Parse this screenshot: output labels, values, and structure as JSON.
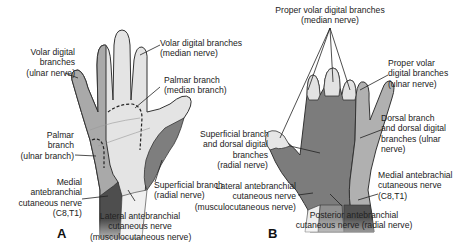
{
  "figure": {
    "panels": [
      {
        "id": "A",
        "view": "palmar",
        "letter": "A",
        "labels": [
          {
            "id": "volar-digital-ulnar",
            "lines": [
              "Volar digital",
              "branches",
              "(ulnar nerve)"
            ]
          },
          {
            "id": "volar-digital-median",
            "lines": [
              "Volar digital branches",
              "(median nerve)"
            ]
          },
          {
            "id": "palmar-branch-median",
            "lines": [
              "Palmar branch",
              "(median branch)"
            ]
          },
          {
            "id": "palmar-branch-ulnar",
            "lines": [
              "Palmar",
              "branch",
              "(ulnar branch)"
            ]
          },
          {
            "id": "medial-antebrachial-A",
            "lines": [
              "Medial",
              "antebranchial",
              "cutaneous nerve",
              "(C8,T1)"
            ]
          },
          {
            "id": "superficial-branch-radial",
            "lines": [
              "Superficial branch",
              "(radial nerve)"
            ]
          },
          {
            "id": "lateral-antebrachial-A",
            "lines": [
              "Lateral antebranchial",
              "cutaneous nerve",
              "(musculocutaneous nerve)"
            ]
          }
        ]
      },
      {
        "id": "B",
        "view": "dorsal",
        "letter": "B",
        "labels": [
          {
            "id": "proper-volar-median",
            "lines": [
              "Proper volar digital branches",
              "(median nerve)"
            ]
          },
          {
            "id": "proper-volar-ulnar",
            "lines": [
              "Proper volar",
              "digital branches",
              "(ulnar nerve)"
            ]
          },
          {
            "id": "superficial-dorsal-radial",
            "lines": [
              "Superficial branch",
              "and dorsal digital",
              "branches",
              "(radial nerve)"
            ]
          },
          {
            "id": "dorsal-branch-ulnar",
            "lines": [
              "Dorsal branch",
              "and dorsal digital",
              "branches (ulnar",
              "nerve)"
            ]
          },
          {
            "id": "lateral-antebrachial-B",
            "lines": [
              "Lateral antebranchial",
              "cutaneous nerve",
              "(musculocutaneous nerve)"
            ]
          },
          {
            "id": "medial-antebrachial-B",
            "lines": [
              "Medial antebrachial",
              "cutaneous nerve",
              "(C8,T1)"
            ]
          },
          {
            "id": "posterior-antebrachial",
            "lines": [
              "Posterior antebranchial",
              "cutaneous nerve (radial nerve)"
            ]
          }
        ]
      }
    ],
    "colors": {
      "ulnar": "#a8a8a8",
      "median": "#e2e2e2",
      "radial": "#7d7d7d",
      "medial_cutaneous": "#4d4d4d",
      "lateral_cutaneous": "#f0f0f0",
      "posterior_cutaneous": "#8f8f8f",
      "outline": "#333333"
    }
  }
}
